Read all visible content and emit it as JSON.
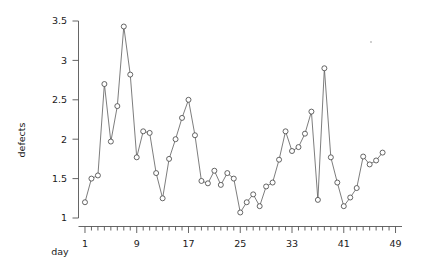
{
  "chart_data": {
    "type": "line",
    "title": "",
    "subtitle": "",
    "xlabel": "day",
    "ylabel": "defects",
    "grid": false,
    "legend": null,
    "marker": "open-circle",
    "xlim": [
      0,
      50
    ],
    "ylim": [
      1,
      3.5
    ],
    "x_ticks_labeled": [
      1,
      9,
      17,
      25,
      33,
      41,
      49
    ],
    "x_tick_labels": [
      "1",
      "9",
      "17",
      "25",
      "33",
      "41",
      "49"
    ],
    "x_minor_tick_step": 1,
    "y_ticks": [
      1,
      1.5,
      2,
      2.5,
      3,
      3.5
    ],
    "y_tick_labels": [
      "1",
      "1.5",
      "2",
      "2.5",
      "3",
      "3.5"
    ],
    "x": [
      1,
      2,
      3,
      4,
      5,
      6,
      7,
      8,
      9,
      10,
      11,
      12,
      13,
      14,
      15,
      16,
      17,
      18,
      19,
      20,
      21,
      22,
      23,
      24,
      25,
      26,
      27,
      28,
      29,
      30,
      31,
      32,
      33,
      34,
      35,
      36,
      37,
      38,
      39,
      40,
      41,
      42,
      43,
      44,
      45,
      46,
      47
    ],
    "values": [
      1.2,
      1.5,
      1.54,
      2.7,
      1.97,
      2.42,
      3.43,
      2.82,
      1.77,
      2.1,
      2.08,
      1.57,
      1.25,
      1.75,
      2.0,
      2.27,
      2.5,
      2.05,
      1.47,
      1.44,
      1.6,
      1.42,
      1.57,
      1.5,
      1.07,
      1.2,
      1.3,
      1.15,
      1.4,
      1.45,
      1.74,
      2.1,
      1.85,
      1.9,
      2.07,
      2.35,
      1.23,
      2.9,
      1.77,
      1.45,
      1.15,
      1.26,
      1.38,
      1.78,
      1.68,
      1.73,
      1.83
    ],
    "series": [
      {
        "name": "defects",
        "values": [
          1.2,
          1.5,
          1.54,
          2.7,
          1.97,
          2.42,
          3.43,
          2.82,
          1.77,
          2.1,
          2.08,
          1.57,
          1.25,
          1.75,
          2.0,
          2.27,
          2.5,
          2.05,
          1.47,
          1.44,
          1.6,
          1.42,
          1.57,
          1.5,
          1.07,
          1.2,
          1.3,
          1.15,
          1.4,
          1.45,
          1.74,
          2.1,
          1.85,
          1.9,
          2.07,
          2.35,
          1.23,
          2.9,
          1.77,
          1.45,
          1.15,
          1.26,
          1.38,
          1.78,
          1.68,
          1.73,
          1.83
        ]
      }
    ],
    "colors": {
      "line": "#5c5c5c",
      "marker_fill": "#ffffff",
      "marker_stroke": "#4a4a4a",
      "axis": "#555555",
      "text": "#1a1a1a",
      "background": "#ffffff"
    }
  }
}
